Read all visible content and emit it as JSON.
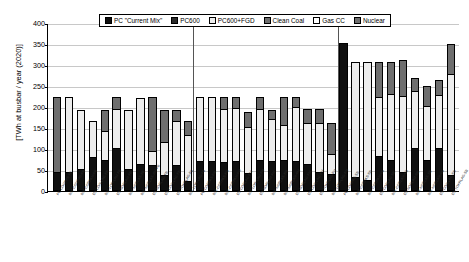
{
  "chart_data": {
    "type": "bar",
    "stacked": true,
    "title": "",
    "xlabel": "",
    "ylabel": "[TWh at busbar / year (2020)]",
    "ylim": [
      0,
      400
    ],
    "yticks": [
      0,
      50,
      100,
      150,
      200,
      250,
      300,
      350,
      400
    ],
    "grid": true,
    "legend_position": "top-center",
    "legend": [
      "PC \"Current Mix\"",
      "PC600",
      "PC600+FGD",
      "Clean Coal",
      "Gas CC",
      "Nuclear"
    ],
    "series_colors": [
      "#101010",
      "#2b2b2b",
      "#ededed",
      "#6e6e6e",
      "#ffffff",
      "#6e6e6e"
    ],
    "group_separators_after": [
      11,
      23
    ],
    "categories": [
      "PC-COMPAS-FB",
      "80X-COMPAS-FB",
      "80X-CORPAM-FB",
      "DX-CON-LAG-FB",
      "80X-LOR-LAM-FB",
      "DX-NORLAM-FB",
      "80X-NORLAS-FB",
      "80X-NORLAS-AM-FB",
      "DX-NORLAG-FB",
      "DX-CON-LAG-FB",
      "DX-TOKRLAG-FB",
      "80X-LOR-LAG-FB",
      "PC-CORPAS-FM",
      "80X-CORPAS-FM",
      "80X-CORPAM-FM",
      "DX-CORLAG-FM",
      "80X-LOR-LAM-FM",
      "DX-NORLAM-FM",
      "80X-NORLAS-FM",
      "80X-NORLAM-FM",
      "DX-NORLAG-FM",
      "DX-CON-LAG-FM",
      "DX-TOKRLAG-FM",
      "80X-LOR-LAG-FM",
      "PC-CORPAS-SB",
      "80X-CORPAS-SB",
      "80X-CONPAM-SB",
      "DX-CORLAG-SB",
      "80X-CORLAM-SB",
      "DX-NORLAM-SB",
      "80X-NORLAS-SB",
      "80X-NORLAM-SB",
      "DX-CON-LAG-SB",
      "DX-TOKRLAG-SB"
    ],
    "series": [
      {
        "name": "PC \"Current Mix\"",
        "values": [
          42,
          42,
          50,
          78,
          72,
          100,
          50,
          62,
          58,
          35,
          60,
          20,
          68,
          68,
          65,
          68,
          40,
          70,
          68,
          72,
          68,
          62,
          42,
          38,
          355,
          30,
          22,
          80,
          70,
          42,
          100,
          72,
          100,
          35
        ]
      },
      {
        "name": "PC600",
        "values": [
          0,
          0,
          0,
          0,
          0,
          0,
          0,
          0,
          0,
          0,
          0,
          0,
          0,
          0,
          0,
          0,
          0,
          0,
          0,
          0,
          0,
          0,
          0,
          0,
          0,
          0,
          0,
          0,
          0,
          0,
          0,
          0,
          0,
          0
        ]
      },
      {
        "name": "PC600+FGD",
        "values": [
          0,
          183,
          145,
          90,
          70,
          95,
          145,
          160,
          35,
          80,
          108,
          112,
          157,
          157,
          130,
          130,
          112,
          125,
          105,
          85,
          132,
          100,
          120,
          48,
          0,
          280,
          288,
          145,
          160,
          185,
          140,
          130,
          130,
          245
        ]
      },
      {
        "name": "Clean Coal",
        "values": [
          0,
          0,
          0,
          0,
          0,
          0,
          0,
          0,
          0,
          0,
          0,
          0,
          0,
          0,
          0,
          0,
          0,
          0,
          0,
          0,
          0,
          0,
          0,
          0,
          0,
          0,
          0,
          0,
          0,
          0,
          0,
          0,
          0,
          0
        ]
      },
      {
        "name": "Gas CC",
        "values": [
          0,
          0,
          0,
          0,
          0,
          0,
          0,
          0,
          0,
          0,
          0,
          0,
          0,
          0,
          0,
          0,
          0,
          0,
          0,
          0,
          0,
          0,
          0,
          0,
          0,
          0,
          0,
          0,
          0,
          0,
          0,
          0,
          0,
          0
        ]
      },
      {
        "name": "Nuclear",
        "values": [
          183,
          0,
          0,
          0,
          53,
          30,
          0,
          0,
          132,
          80,
          25,
          35,
          0,
          0,
          30,
          27,
          38,
          30,
          22,
          68,
          25,
          35,
          35,
          78,
          0,
          0,
          0,
          85,
          80,
          88,
          30,
          50,
          35,
          72
        ]
      }
    ]
  }
}
